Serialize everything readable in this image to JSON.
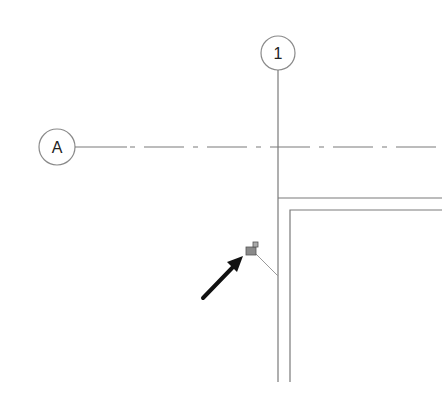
{
  "drawing": {
    "grid_vertical": {
      "label": "1",
      "x": 278,
      "bubble_cy": 53,
      "bubble_r": 17
    },
    "grid_horizontal": {
      "label": "A",
      "y": 147,
      "bubble_cx": 57,
      "bubble_r": 18
    },
    "wall_outer": {
      "x": 278,
      "y": 198
    },
    "wall_inner": {
      "x": 290,
      "y": 210
    },
    "tag": {
      "icon": "pin-tag-icon",
      "x": 250,
      "y": 248,
      "color": "#8a8a8a"
    },
    "leader_line": {
      "from": [
        256,
        254
      ],
      "to": [
        278,
        276
      ]
    },
    "arrow": {
      "icon": "arrow-pointer-icon",
      "from": [
        203,
        298
      ],
      "to": [
        243,
        258
      ],
      "color": "#111111"
    },
    "line_color": "#7a7a7a"
  }
}
